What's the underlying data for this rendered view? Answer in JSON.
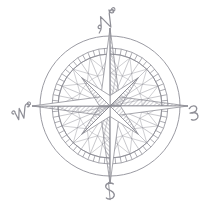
{
  "figure": {
    "kind": "compass-rose-engraving",
    "background_color": "#ffffff",
    "ink_color": "#8a8a92",
    "hatch_color": "#9a9aa2"
  },
  "compass": {
    "center": {
      "x": 110,
      "y": 106
    },
    "outer_circle_radius": 70,
    "scale_ring_outer_radius": 58,
    "scale_ring_inner_radius": 52,
    "web_circle_radius": 52,
    "star_major_radius": 78,
    "star_minor_radius": 40,
    "star_waist_radius": 13,
    "tick_count": 64,
    "labels": [
      {
        "name": "north",
        "text": "N",
        "angle_deg": 0,
        "x": 110,
        "y": 22
      },
      {
        "name": "east",
        "text": "E",
        "angle_deg": 90,
        "x": 194,
        "y": 112
      },
      {
        "name": "south",
        "text": "S",
        "angle_deg": 180,
        "x": 110,
        "y": 196
      },
      {
        "name": "west",
        "text": "W",
        "angle_deg": 270,
        "x": 26,
        "y": 112
      }
    ],
    "star_points": [
      {
        "name": "north",
        "angle_deg": 0,
        "kind": "major",
        "shaded_side": "right"
      },
      {
        "name": "east",
        "angle_deg": 90,
        "kind": "major",
        "shaded_side": "left"
      },
      {
        "name": "south",
        "angle_deg": 180,
        "kind": "major",
        "shaded_side": "right"
      },
      {
        "name": "west",
        "angle_deg": 270,
        "kind": "major",
        "shaded_side": "left"
      },
      {
        "name": "northeast",
        "angle_deg": 45,
        "kind": "minor",
        "shaded_side": "right"
      },
      {
        "name": "southeast",
        "angle_deg": 135,
        "kind": "minor",
        "shaded_side": "left"
      },
      {
        "name": "southwest",
        "angle_deg": 225,
        "kind": "minor",
        "shaded_side": "right"
      },
      {
        "name": "northwest",
        "angle_deg": 315,
        "kind": "minor",
        "shaded_side": "left"
      }
    ],
    "web_spokes": 32
  }
}
